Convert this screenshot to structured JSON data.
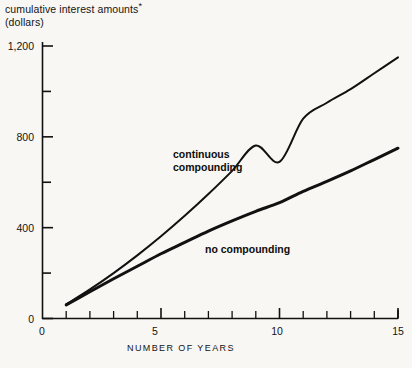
{
  "chart_data": {
    "type": "line",
    "title": "",
    "ylabel": "cumulative interest amounts*",
    "ylabel_units": "(dollars)",
    "ylabel_footnote_mark": "*",
    "xlabel": "NUMBER OF YEARS",
    "xlim": [
      0,
      15
    ],
    "ylim": [
      0,
      1200
    ],
    "grid": false,
    "legend_position": "inline-annotations",
    "yticks_major": [
      0,
      400,
      800,
      1200
    ],
    "yticks_major_labels": [
      "0",
      "400",
      "800",
      "1,200"
    ],
    "yticks_minor": [
      200,
      600,
      1000
    ],
    "xticks_major": [
      0,
      5,
      10,
      15
    ],
    "xticks_major_labels": [
      "0",
      "5",
      "10",
      "15"
    ],
    "xticks_minor": [
      1,
      2,
      3,
      4,
      6,
      7,
      8,
      9,
      11,
      12,
      13,
      14
    ],
    "x": [
      1,
      2,
      3,
      4,
      5,
      6,
      7,
      8,
      9,
      10,
      11,
      12,
      13,
      14,
      15
    ],
    "series": [
      {
        "name": "continuous compounding",
        "label": "continuous\ncompounding",
        "label_line1": "continuous",
        "label_line2": "compounding",
        "color": "#111111",
        "values": [
          62,
          130,
          205,
          287,
          377,
          476,
          584,
          703,
          833,
          690,
          1150,
          0,
          0,
          0,
          0
        ]
      },
      {
        "name": "no compounding",
        "label": "no compounding",
        "color": "#111111",
        "values": [
          60,
          120,
          180,
          240,
          300,
          350,
          400,
          450,
          480,
          510,
          560,
          600,
          640,
          690,
          750
        ]
      }
    ],
    "series_continuous_values": [
      62,
      128,
      200,
      278,
      362,
      452,
      548,
      650,
      762,
      690,
      880,
      950,
      1010,
      1080,
      1150
    ],
    "series_nocompounding_values": [
      60,
      118,
      175,
      230,
      285,
      335,
      385,
      430,
      472,
      510,
      560,
      604,
      650,
      700,
      750
    ],
    "annotations": [
      {
        "text": "continuous compounding",
        "x": 7,
        "y": 620
      },
      {
        "text": "no compounding",
        "x": 9.5,
        "y": 330
      }
    ]
  },
  "axis": {
    "y_title_line1": "cumulative interest amounts",
    "y_title_line2": "(dollars)",
    "x_title": "NUMBER OF YEARS"
  },
  "labels": {
    "y0": "0",
    "y400": "400",
    "y800": "800",
    "y1200": "1,200",
    "x0": "0",
    "x5": "5",
    "x10": "10",
    "x15": "15",
    "continuous_l1": "continuous",
    "continuous_l2": "compounding",
    "nocompounding": "no compounding",
    "footnote_mark": "*"
  },
  "colors": {
    "background": "#f8f7f3",
    "ink": "#111111",
    "curve": "#111111"
  }
}
